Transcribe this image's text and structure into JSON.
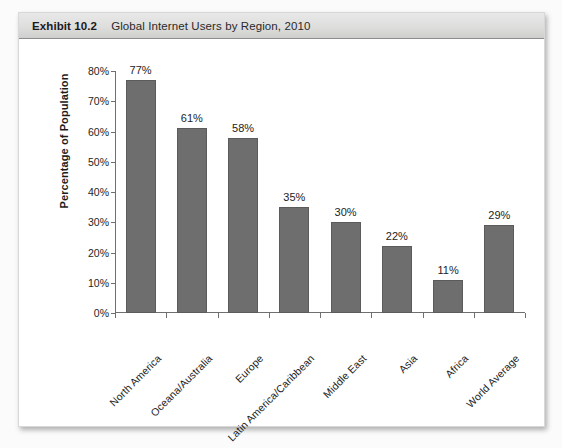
{
  "exhibit": {
    "number": "Exhibit 10.2",
    "title": "Global Internet Users by Region, 2010"
  },
  "chart_data": {
    "type": "bar",
    "title": "Global Internet Users by Region, 2010",
    "xlabel": "",
    "ylabel": "Percentage of Population",
    "ylim": [
      0,
      80
    ],
    "ytick_step": 10,
    "grid": false,
    "legend": "none",
    "bar_color": "#6e6e6e",
    "value_suffix": "%",
    "categories": [
      "North America",
      "Oceana/Australia",
      "Europe",
      "Latin America/Caribbean",
      "Middle East",
      "Asia",
      "Africa",
      "World Average"
    ],
    "values": [
      77,
      61,
      58,
      35,
      30,
      22,
      11,
      29
    ],
    "value_labels": [
      "77%",
      "61%",
      "58%",
      "35%",
      "30%",
      "22%",
      "11%",
      "29%"
    ],
    "ytick_labels": [
      "0%",
      "10%",
      "20%",
      "30%",
      "40%",
      "50%",
      "60%",
      "70%",
      "80%"
    ],
    "ytick_values": [
      0,
      10,
      20,
      30,
      40,
      50,
      60,
      70,
      80
    ]
  }
}
